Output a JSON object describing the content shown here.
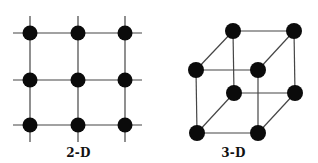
{
  "figure": {
    "background": "#ffffff",
    "node_color": "#0b0b0b",
    "line_color": "#454545",
    "line_width": 1.2,
    "label_color": "#111111",
    "panels": [
      {
        "id": "2d",
        "type": "square-lattice",
        "label": "2-D",
        "node_radius": 7.5,
        "columns": [
          30,
          78,
          125
        ],
        "rows": [
          33,
          80,
          125
        ],
        "stub_length": 17
      },
      {
        "id": "3d",
        "type": "cubic-lattice",
        "label": "3-D",
        "node_radius": 8,
        "nodes": {
          "front_top_left": [
            196,
            70
          ],
          "front_top_right": [
            258,
            70
          ],
          "front_bottom_left": [
            197,
            133
          ],
          "front_bottom_right": [
            258,
            133
          ],
          "back_top_left": [
            233,
            31
          ],
          "back_top_right": [
            294,
            31
          ],
          "back_bottom_left": [
            234,
            93
          ],
          "back_bottom_right": [
            295,
            93
          ]
        },
        "edges": [
          [
            "front_top_left",
            "front_top_right"
          ],
          [
            "front_top_right",
            "front_bottom_right"
          ],
          [
            "front_bottom_right",
            "front_bottom_left"
          ],
          [
            "front_bottom_left",
            "front_top_left"
          ],
          [
            "back_top_left",
            "back_top_right"
          ],
          [
            "back_top_right",
            "back_bottom_right"
          ],
          [
            "back_bottom_right",
            "back_bottom_left"
          ],
          [
            "back_bottom_left",
            "back_top_left"
          ],
          [
            "front_top_left",
            "back_top_left"
          ],
          [
            "front_top_right",
            "back_top_right"
          ],
          [
            "front_bottom_left",
            "back_bottom_left"
          ],
          [
            "front_bottom_right",
            "back_bottom_right"
          ]
        ]
      }
    ]
  }
}
